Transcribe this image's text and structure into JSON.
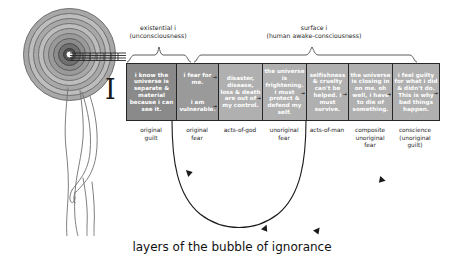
{
  "caption": "layers of the bubble of ignorance",
  "groups": {
    "existential": {
      "line1": "existential i",
      "line2": "(unconsciousness)"
    },
    "surface": {
      "line1": "surface i",
      "line2": "(human awake-consciousness)"
    }
  },
  "brackets": {
    "left": "I",
    "right": "I"
  },
  "cells": [
    {
      "text": "i know the universe is separate & material because i can see it.",
      "shade": "dark",
      "arrow": ""
    },
    {
      "text_top": "i fear for me.",
      "text_bottom": "i am vulnerable.",
      "shade": "mid",
      "arrow": "→",
      "split": true
    },
    {
      "text": "disaster, disease, loss & death are out of my control.",
      "shade": "light",
      "arrow": "→"
    },
    {
      "text": "the universe is frightening. i must protect & defend my self.",
      "shade": "light",
      "arrow": "→"
    },
    {
      "text": "selfishness & cruelty can't be helped. i must survive.",
      "shade": "light",
      "arrow": "→"
    },
    {
      "text": "the universe is closing in on me. oh well, i have to die of something.",
      "shade": "light",
      "arrow": "→"
    },
    {
      "text": "i feel guilty for what i did & didn't do. This is why bad things happen.",
      "shade": "light",
      "arrow": "→"
    }
  ],
  "labels": [
    {
      "line1": "original",
      "line2": "guilt",
      "line3": ""
    },
    {
      "line1": "original",
      "line2": "fear",
      "line3": ""
    },
    {
      "line1": "acts-of-god",
      "line2": "",
      "line3": ""
    },
    {
      "line1": "unoriginal",
      "line2": "fear",
      "line3": ""
    },
    {
      "line1": "acts-of-man",
      "line2": "",
      "line3": ""
    },
    {
      "line1": "composite",
      "line2": "unoriginal",
      "line3": "fear"
    },
    {
      "line1": "conscience",
      "line2": "(unoriginal",
      "line3": "guilt)"
    }
  ],
  "colors": {
    "cell_dark": "#8a8a8a",
    "cell_mid": "#9a9a9a",
    "cell_light": "#b0b0b0",
    "ring_stroke": "#6f6f6f",
    "outline": "#262626",
    "text_on_cell": "#ffffff",
    "background": "#ffffff"
  },
  "figures": {
    "spiral": "concentric-rings-target",
    "person": "standing-human-side-view-outline",
    "bubble": "large-downward-arc-with-arrowheads"
  }
}
